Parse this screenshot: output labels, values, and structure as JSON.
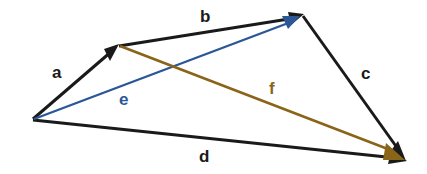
{
  "diagram": {
    "background_color": "#ffffff",
    "colors": {
      "black": "#1a1a1a",
      "blue": "#2b5797",
      "brown": "#8a6418"
    },
    "labels": {
      "a": "a",
      "b": "b",
      "c": "c",
      "d": "d",
      "e": "e",
      "f": "f"
    },
    "vectors": [
      {
        "name": "a",
        "label": "a",
        "color": "#1a1a1a",
        "from": [
          33,
          119
        ],
        "to": [
          117,
          47
        ],
        "label_pos": [
          52,
          64
        ],
        "arrow": "end"
      },
      {
        "name": "b",
        "label": "b",
        "color": "#1a1a1a",
        "from": [
          119,
          46
        ],
        "to": [
          302,
          16
        ],
        "label_pos": [
          200,
          8
        ],
        "arrow": "end"
      },
      {
        "name": "c",
        "label": "c",
        "color": "#1a1a1a",
        "from": [
          303,
          16
        ],
        "to": [
          405,
          159
        ],
        "label_pos": [
          361,
          63
        ],
        "arrow": "end"
      },
      {
        "name": "d",
        "label": "d",
        "color": "#1a1a1a",
        "from": [
          33,
          120
        ],
        "to": [
          406,
          160
        ],
        "label_pos": [
          199,
          144
        ],
        "arrow": "end"
      },
      {
        "name": "e",
        "label": "e",
        "color": "#2b5797",
        "from": [
          34,
          119
        ],
        "to": [
          300,
          18
        ],
        "label_pos": [
          119,
          90
        ],
        "arrow": "end"
      },
      {
        "name": "f",
        "label": "f",
        "color": "#8a6418",
        "from": [
          120,
          46
        ],
        "to": [
          404,
          159
        ],
        "label_pos": [
          269,
          78
        ],
        "arrow": "end"
      }
    ]
  }
}
